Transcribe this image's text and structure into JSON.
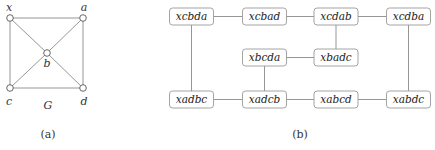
{
  "graph_g": {
    "name": "G",
    "caption": "(a)",
    "vertices": [
      {
        "id": "x",
        "label": "x"
      },
      {
        "id": "a",
        "label": "a"
      },
      {
        "id": "b",
        "label": "b"
      },
      {
        "id": "c",
        "label": "c"
      },
      {
        "id": "d",
        "label": "d"
      }
    ],
    "edges": [
      [
        "x",
        "a"
      ],
      [
        "x",
        "c"
      ],
      [
        "a",
        "d"
      ],
      [
        "c",
        "d"
      ],
      [
        "x",
        "b"
      ],
      [
        "b",
        "d"
      ],
      [
        "a",
        "b"
      ],
      [
        "b",
        "c"
      ]
    ]
  },
  "graph_b": {
    "caption": "(b)",
    "nodes": [
      {
        "id": "xcbda",
        "label": "xcbda"
      },
      {
        "id": "xcbad",
        "label": "xcbad"
      },
      {
        "id": "xcdab",
        "label": "xcdab"
      },
      {
        "id": "xcdba",
        "label": "xcdba"
      },
      {
        "id": "xbcda",
        "label": "xbcda"
      },
      {
        "id": "xbadc",
        "label": "xbadc"
      },
      {
        "id": "xadbc",
        "label": "xadbc"
      },
      {
        "id": "xadcb",
        "label": "xadcb"
      },
      {
        "id": "xabcd",
        "label": "xabcd"
      },
      {
        "id": "xabdc",
        "label": "xabdc"
      }
    ],
    "edges": [
      [
        "xcbda",
        "xcbad"
      ],
      [
        "xcbad",
        "xcdab"
      ],
      [
        "xcdab",
        "xcdba"
      ],
      [
        "xcdab",
        "xbadc"
      ],
      [
        "xbcda",
        "xbadc"
      ],
      [
        "xbcda",
        "xadcb"
      ],
      [
        "xcbda",
        "xadbc"
      ],
      [
        "xcdba",
        "xabdc"
      ],
      [
        "xadbc",
        "xadcb"
      ],
      [
        "xadcb",
        "xabcd"
      ],
      [
        "xabcd",
        "xabdc"
      ]
    ]
  }
}
